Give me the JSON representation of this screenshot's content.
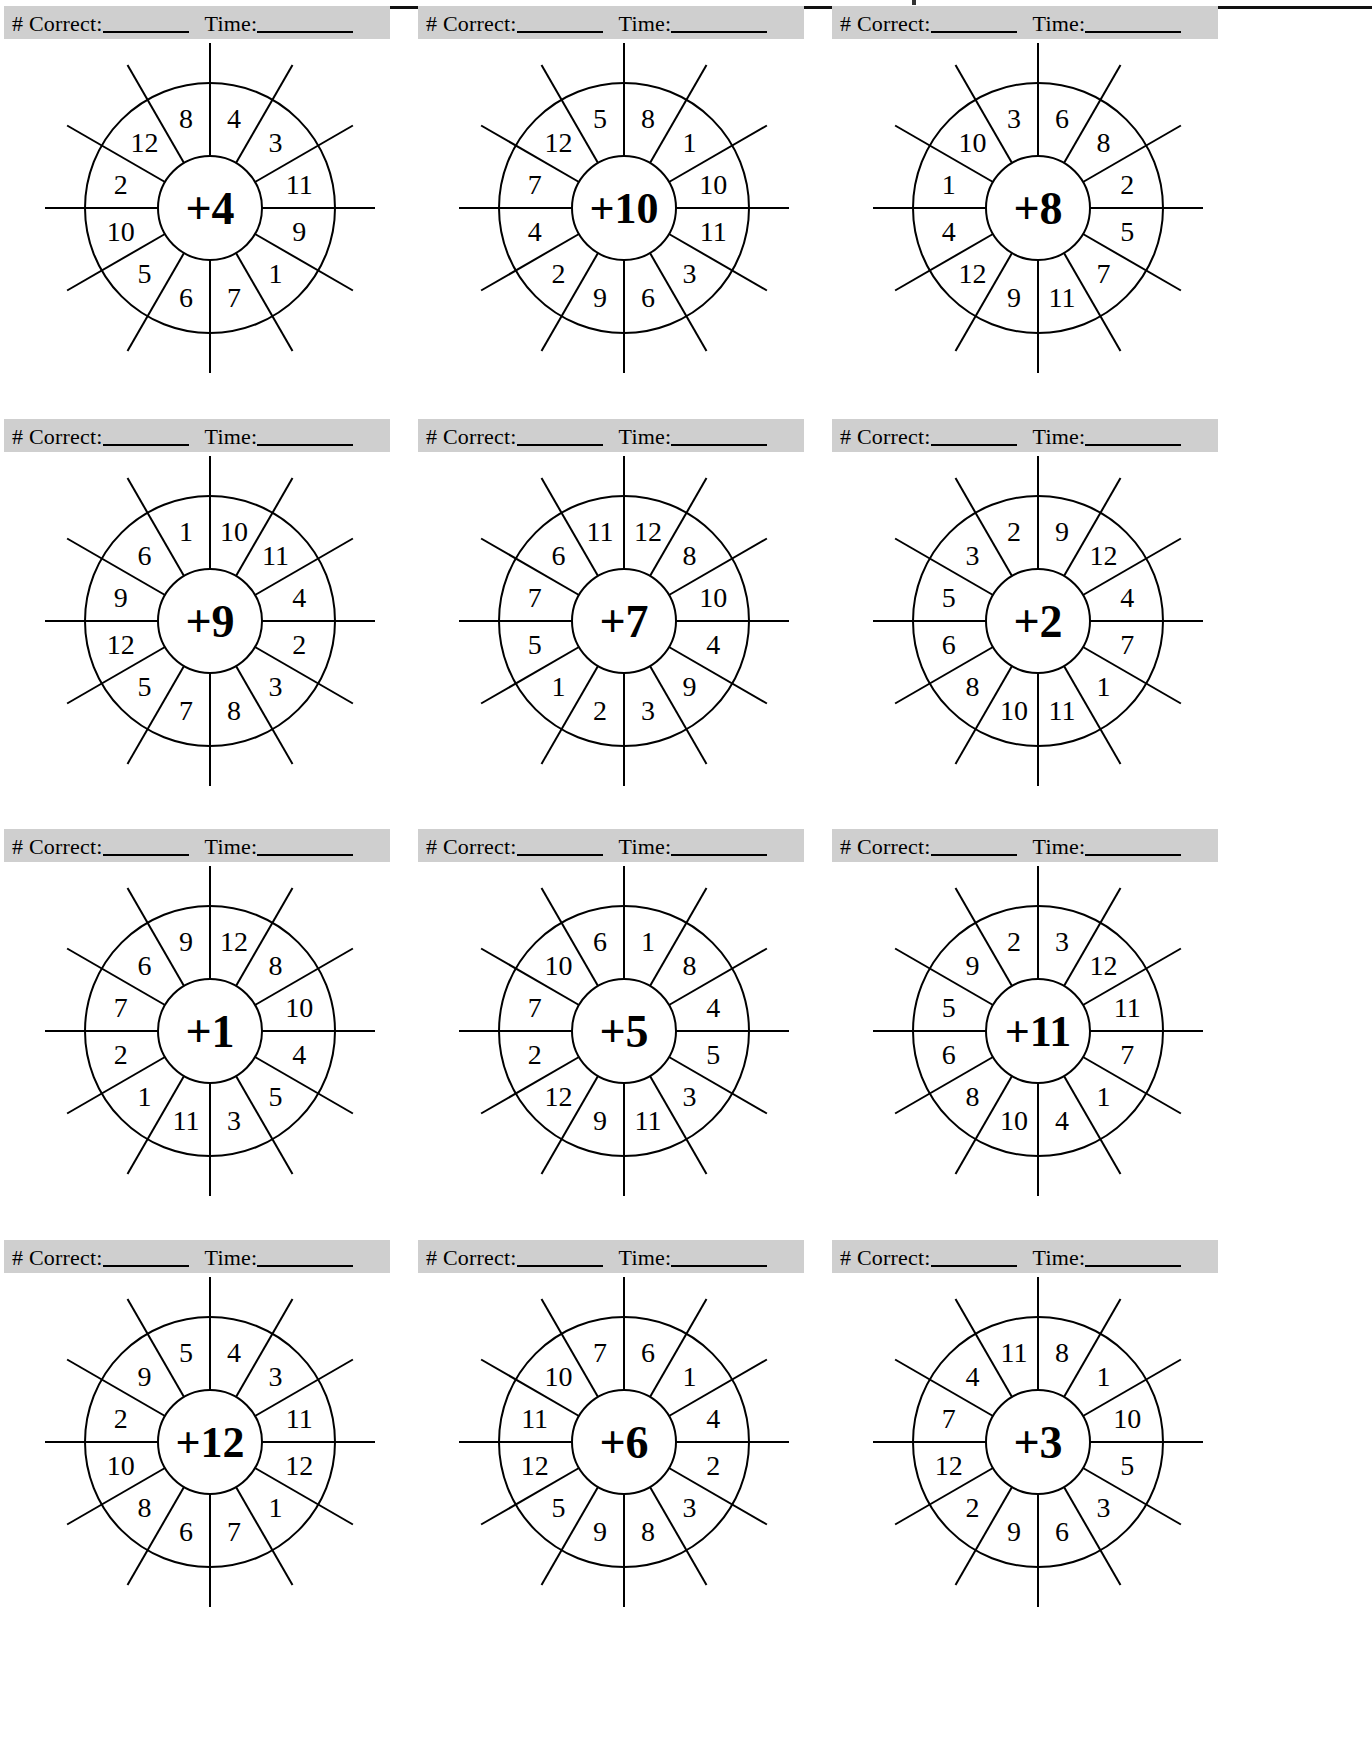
{
  "page": {
    "background_color": "#ffffff",
    "ink_color": "#000000",
    "scorebar_fill": "#cfcfcf",
    "columns": 3,
    "rows": 4
  },
  "scorebar": {
    "correct_label": "# Correct:",
    "time_label": "Time:",
    "correct_value": "",
    "time_value": "",
    "correct_placeholder": "________",
    "time_placeholder": "_________"
  },
  "wheel_geometry": {
    "sectors": 12,
    "hub_radius": 52,
    "inner_radius": 54,
    "outer_radius": 125,
    "spoke_overshoot": 40,
    "center_x": 210,
    "center_y": 176,
    "first_sector_start_deg": -90,
    "sector_sweep_deg": 30
  },
  "wheels": [
    {
      "id": "wheel-plus-4",
      "operator": "+",
      "operand": "4",
      "hub": "+4",
      "numbers": [
        "4",
        "3",
        "11",
        "9",
        "1",
        "7",
        "6",
        "5",
        "10",
        "2",
        "12",
        "8"
      ]
    },
    {
      "id": "wheel-plus-10",
      "operator": "+",
      "operand": "10",
      "hub": "+10",
      "numbers": [
        "8",
        "1",
        "10",
        "11",
        "3",
        "6",
        "9",
        "2",
        "4",
        "7",
        "12",
        "5"
      ]
    },
    {
      "id": "wheel-plus-8",
      "operator": "+",
      "operand": "8",
      "hub": "+8",
      "numbers": [
        "6",
        "8",
        "2",
        "5",
        "7",
        "11",
        "9",
        "12",
        "4",
        "1",
        "10",
        "3"
      ]
    },
    {
      "id": "wheel-plus-9",
      "operator": "+",
      "operand": "9",
      "hub": "+9",
      "numbers": [
        "10",
        "11",
        "4",
        "2",
        "3",
        "8",
        "7",
        "5",
        "12",
        "9",
        "6",
        "1"
      ]
    },
    {
      "id": "wheel-plus-7",
      "operator": "+",
      "operand": "7",
      "hub": "+7",
      "numbers": [
        "12",
        "8",
        "10",
        "4",
        "9",
        "3",
        "2",
        "1",
        "5",
        "7",
        "6",
        "11"
      ]
    },
    {
      "id": "wheel-plus-2",
      "operator": "+",
      "operand": "2",
      "hub": "+2",
      "numbers": [
        "9",
        "12",
        "4",
        "7",
        "1",
        "11",
        "10",
        "8",
        "6",
        "5",
        "3",
        "2"
      ]
    },
    {
      "id": "wheel-plus-1",
      "operator": "+",
      "operand": "1",
      "hub": "+1",
      "numbers": [
        "12",
        "8",
        "10",
        "4",
        "5",
        "3",
        "11",
        "1",
        "2",
        "7",
        "6",
        "9"
      ]
    },
    {
      "id": "wheel-plus-5",
      "operator": "+",
      "operand": "5",
      "hub": "+5",
      "numbers": [
        "1",
        "8",
        "4",
        "5",
        "3",
        "11",
        "9",
        "12",
        "2",
        "7",
        "10",
        "6"
      ]
    },
    {
      "id": "wheel-plus-11",
      "operator": "+",
      "operand": "11",
      "hub": "+11",
      "numbers": [
        "3",
        "12",
        "11",
        "7",
        "1",
        "4",
        "10",
        "8",
        "6",
        "5",
        "9",
        "2"
      ]
    },
    {
      "id": "wheel-plus-12",
      "operator": "+",
      "operand": "12",
      "hub": "+12",
      "numbers": [
        "4",
        "3",
        "11",
        "12",
        "1",
        "7",
        "6",
        "8",
        "10",
        "2",
        "9",
        "5"
      ]
    },
    {
      "id": "wheel-plus-6",
      "operator": "+",
      "operand": "6",
      "hub": "+6",
      "numbers": [
        "6",
        "1",
        "4",
        "2",
        "3",
        "8",
        "9",
        "5",
        "12",
        "11",
        "10",
        "7"
      ]
    },
    {
      "id": "wheel-plus-3",
      "operator": "+",
      "operand": "3",
      "hub": "+3",
      "numbers": [
        "8",
        "1",
        "10",
        "5",
        "3",
        "6",
        "9",
        "2",
        "12",
        "7",
        "4",
        "11"
      ]
    }
  ]
}
